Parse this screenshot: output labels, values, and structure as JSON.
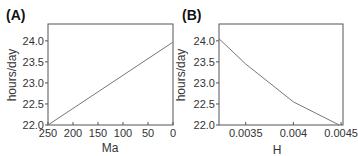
{
  "chart_data": [
    {
      "panel_label": "(A)",
      "type": "line",
      "xlabel": "Ma",
      "ylabel": "hours/day",
      "xlim": [
        250,
        0
      ],
      "ylim": [
        22.0,
        24.4
      ],
      "x_reversed": true,
      "xticks": [
        "250",
        "200",
        "150",
        "100",
        "50",
        "0"
      ],
      "yticks": [
        "22.0",
        "22.5",
        "23.0",
        "23.5",
        "24.0"
      ],
      "grid": false,
      "series": [
        {
          "name": "day length",
          "x": [
            250,
            0
          ],
          "y": [
            22.0,
            23.97
          ]
        }
      ]
    },
    {
      "panel_label": "(B)",
      "type": "line",
      "xlabel": "H",
      "ylabel": "hours/day",
      "xlim": [
        0.00322,
        0.00452
      ],
      "ylim": [
        22.0,
        24.4
      ],
      "xticks": [
        "0.0035",
        "0.004",
        "0.0045"
      ],
      "yticks": [
        "22.0",
        "22.5",
        "23.0",
        "23.5",
        "24.0"
      ],
      "grid": false,
      "series": [
        {
          "name": "day length",
          "x": [
            0.00322,
            0.0035,
            0.004,
            0.00448
          ],
          "y": [
            24.05,
            23.45,
            22.55,
            22.0
          ]
        }
      ]
    }
  ]
}
